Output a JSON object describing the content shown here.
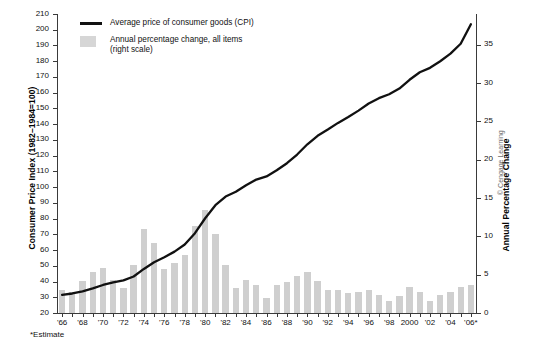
{
  "figure": {
    "footnote": "*Estimate",
    "credit": "© Cengage Learning"
  },
  "legend": {
    "items": [
      {
        "label": "Average price of consumer goods (CPI)",
        "marker": "line",
        "color": "#111111"
      },
      {
        "label": "Annual percentage change, all items\n(right scale)",
        "line1": "Annual percentage change, all items",
        "line2": "(right scale)",
        "marker": "bar",
        "color": "#d6d6d6"
      }
    ]
  },
  "axes": {
    "left": {
      "title": "Consumer Price Index (1982–1984=100)",
      "min": 20,
      "max": 210,
      "step": 10,
      "ticks": [
        20,
        30,
        40,
        50,
        60,
        70,
        80,
        90,
        100,
        110,
        120,
        130,
        140,
        150,
        160,
        170,
        180,
        190,
        200,
        210
      ]
    },
    "right": {
      "title": "Annual Percentage Change",
      "min": 0,
      "max": 39,
      "step": 5,
      "ticks": [
        0,
        5,
        10,
        15,
        20,
        25,
        30,
        35
      ]
    },
    "bottom": {
      "labels": [
        "'66",
        "'68",
        "'70",
        "'72",
        "'74",
        "'76",
        "'78",
        "'80",
        "'82",
        "'84",
        "'86",
        "'88",
        "'90",
        "'92",
        "'94",
        "'96",
        "'98",
        "2000",
        "'02",
        "'04",
        "'06*"
      ],
      "label_years": [
        1966,
        1968,
        1970,
        1972,
        1974,
        1976,
        1978,
        1980,
        1982,
        1984,
        1986,
        1988,
        1990,
        1992,
        1994,
        1996,
        1998,
        2000,
        2002,
        2004,
        2006
      ]
    }
  },
  "chart_data": {
    "type": "bar",
    "title": "",
    "xlabel": "",
    "ylabel": "Consumer Price Index (1982–1984=100)",
    "y2label": "Annual Percentage Change",
    "ylim": [
      20,
      210
    ],
    "y2lim": [
      0,
      39
    ],
    "grid": false,
    "legend_position": "top-left",
    "categories": [
      1966,
      1967,
      1968,
      1969,
      1970,
      1971,
      1972,
      1973,
      1974,
      1975,
      1976,
      1977,
      1978,
      1979,
      1980,
      1981,
      1982,
      1983,
      1984,
      1985,
      1986,
      1987,
      1988,
      1989,
      1990,
      1991,
      1992,
      1993,
      1994,
      1995,
      1996,
      1997,
      1998,
      1999,
      2000,
      2001,
      2002,
      2003,
      2004,
      2005,
      2006
    ],
    "series": [
      {
        "name": "Annual percentage change, all items (right scale)",
        "type": "bar",
        "axis": "right",
        "color": "#cfcfcf",
        "values": [
          3.0,
          2.8,
          4.2,
          5.4,
          5.9,
          4.3,
          3.3,
          6.2,
          11.0,
          9.1,
          5.8,
          6.5,
          7.6,
          11.3,
          13.5,
          10.3,
          6.2,
          3.2,
          4.3,
          3.6,
          1.9,
          3.6,
          4.1,
          4.8,
          5.4,
          4.2,
          3.0,
          3.0,
          2.6,
          2.8,
          3.0,
          2.3,
          1.6,
          2.2,
          3.4,
          2.8,
          1.6,
          2.3,
          2.7,
          3.4,
          3.6
        ]
      },
      {
        "name": "Average price of consumer goods (CPI)",
        "type": "line",
        "axis": "left",
        "color": "#111111",
        "values": [
          31.5,
          32.4,
          33.8,
          35.6,
          37.8,
          39.4,
          40.7,
          43.2,
          48.0,
          52.3,
          55.4,
          59.0,
          63.5,
          70.7,
          80.2,
          88.5,
          94.0,
          97.0,
          101.2,
          104.8,
          106.8,
          110.7,
          115.2,
          120.7,
          127.2,
          132.6,
          136.6,
          140.8,
          144.6,
          148.6,
          153.1,
          156.5,
          159.0,
          162.6,
          168.2,
          173.0,
          175.8,
          180.0,
          184.8,
          191.1,
          203.5
        ]
      }
    ]
  }
}
